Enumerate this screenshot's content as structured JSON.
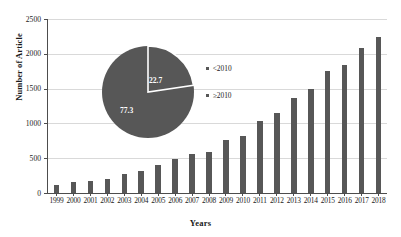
{
  "chart_data": {
    "type": "bar",
    "title": "",
    "xlabel": "Years",
    "ylabel": "Number of Article",
    "categories": [
      "1999",
      "2000",
      "2001",
      "2002",
      "2003",
      "2004",
      "2005",
      "2006",
      "2007",
      "2008",
      "2009",
      "2010",
      "2011",
      "2012",
      "2013",
      "2014",
      "2015",
      "2016",
      "2017",
      "2018"
    ],
    "values": [
      110,
      155,
      175,
      200,
      280,
      315,
      405,
      490,
      555,
      595,
      755,
      825,
      1030,
      1155,
      1370,
      1500,
      1760,
      1840,
      2080,
      2235
    ],
    "ylim": [
      0,
      2500
    ],
    "yticks": [
      0,
      500,
      1000,
      1500,
      2000,
      2500
    ],
    "ytick_labels": [
      "0",
      "500",
      "1000",
      "1500",
      "2000",
      "2500"
    ],
    "grid": true,
    "bar_color": "#575757",
    "gridline_color": "#d9d9d9",
    "axis_color": "#4d4d4d",
    "inset": {
      "type": "pie",
      "labels": [
        "<2010",
        "≥2010"
      ],
      "values": [
        22.7,
        77.3
      ],
      "value_labels": [
        "22.7",
        "77.3"
      ],
      "slice_color": "#575757",
      "divider_color": "#ffffff",
      "legend_position": "right"
    }
  }
}
